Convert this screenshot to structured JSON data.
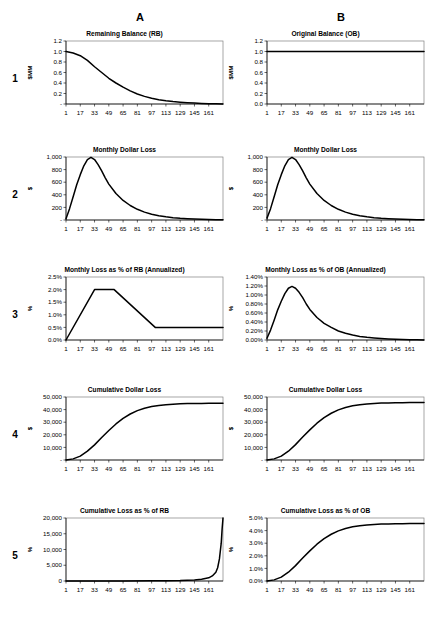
{
  "figure": {
    "column_headers": [
      {
        "label": "A",
        "x": 140
      },
      {
        "label": "B",
        "x": 341
      }
    ],
    "row_numbers": [
      "1",
      "2",
      "3",
      "4",
      "5"
    ],
    "x_tick_labels": [
      "1",
      "17",
      "33",
      "49",
      "65",
      "81",
      "97",
      "113",
      "129",
      "145",
      "161"
    ],
    "x_domain": [
      1,
      177
    ],
    "line_color": "#000000",
    "frame_color": "#808080"
  },
  "chart_data": [
    {
      "id": "r1a",
      "type": "line",
      "title": "Remaining Balance (RB)",
      "row": "1",
      "column": "A",
      "xlabel": "",
      "ylabel": "$MM",
      "ylim": [
        0,
        1.2
      ],
      "ytick_labels": [
        "-",
        "0.2",
        "0.4",
        "0.6",
        "0.8",
        "1.0",
        "1.2"
      ],
      "ytick_values": [
        0,
        0.2,
        0.4,
        0.6,
        0.8,
        1.0,
        1.2
      ],
      "xtick_values": [
        1,
        17,
        33,
        49,
        65,
        81,
        97,
        113,
        129,
        145,
        161
      ],
      "x": [
        1,
        9,
        17,
        25,
        33,
        41,
        49,
        57,
        65,
        73,
        81,
        89,
        97,
        105,
        113,
        121,
        129,
        137,
        145,
        153,
        161,
        169,
        177
      ],
      "y": [
        1.0,
        0.97,
        0.92,
        0.83,
        0.71,
        0.6,
        0.49,
        0.4,
        0.32,
        0.25,
        0.19,
        0.145,
        0.11,
        0.083,
        0.062,
        0.046,
        0.034,
        0.024,
        0.017,
        0.011,
        0.007,
        0.003,
        0.0
      ]
    },
    {
      "id": "r1b",
      "type": "line",
      "title": "Original Balance (OB)",
      "row": "1",
      "column": "B",
      "xlabel": "",
      "ylabel": "$MM",
      "ylim": [
        0,
        1.2
      ],
      "ytick_labels": [
        "0.0",
        "0.2",
        "0.4",
        "0.6",
        "0.8",
        "1.0",
        "1.2"
      ],
      "ytick_values": [
        0,
        0.2,
        0.4,
        0.6,
        0.8,
        1.0,
        1.2
      ],
      "xtick_values": [
        1,
        17,
        33,
        49,
        65,
        81,
        97,
        113,
        129,
        145,
        161
      ],
      "x": [
        1,
        177
      ],
      "y": [
        1.0,
        1.0
      ]
    },
    {
      "id": "r2a",
      "type": "line",
      "title": "Monthly Dollar Loss",
      "row": "2",
      "column": "A",
      "xlabel": "",
      "ylabel": "$",
      "ylim": [
        0,
        1000
      ],
      "ytick_labels": [
        "-",
        "200",
        "400",
        "600",
        "800",
        "1,000"
      ],
      "ytick_values": [
        0,
        200,
        400,
        600,
        800,
        1000
      ],
      "xtick_values": [
        1,
        17,
        33,
        49,
        65,
        81,
        97,
        113,
        129,
        145,
        161
      ],
      "x": [
        1,
        5,
        9,
        13,
        17,
        21,
        25,
        29,
        33,
        37,
        41,
        45,
        49,
        57,
        65,
        73,
        81,
        89,
        97,
        105,
        113,
        121,
        129,
        137,
        145,
        153,
        161,
        169,
        177
      ],
      "y": [
        20,
        180,
        370,
        560,
        720,
        860,
        960,
        995,
        960,
        880,
        780,
        670,
        570,
        420,
        310,
        230,
        170,
        125,
        92,
        68,
        50,
        37,
        27,
        20,
        14,
        10,
        7,
        4,
        2
      ]
    },
    {
      "id": "r2b",
      "type": "line",
      "title": "Monthly Dollar Loss",
      "row": "2",
      "column": "B",
      "xlabel": "",
      "ylabel": "$",
      "ylim": [
        0,
        1000
      ],
      "ytick_labels": [
        "-",
        "200",
        "400",
        "600",
        "800",
        "1,000"
      ],
      "ytick_values": [
        0,
        200,
        400,
        600,
        800,
        1000
      ],
      "xtick_values": [
        1,
        17,
        33,
        49,
        65,
        81,
        97,
        113,
        129,
        145,
        161
      ],
      "x": [
        1,
        5,
        9,
        13,
        17,
        21,
        25,
        29,
        33,
        37,
        41,
        45,
        49,
        57,
        65,
        73,
        81,
        89,
        97,
        105,
        113,
        121,
        129,
        137,
        145,
        153,
        161,
        169,
        177
      ],
      "y": [
        30,
        180,
        370,
        560,
        720,
        860,
        960,
        995,
        960,
        880,
        780,
        670,
        570,
        420,
        310,
        230,
        170,
        125,
        92,
        68,
        50,
        37,
        27,
        20,
        14,
        10,
        7,
        4,
        2
      ]
    },
    {
      "id": "r3a",
      "type": "line",
      "title": "Monthly Loss as % of RB (Annualized)",
      "row": "3",
      "column": "A",
      "xlabel": "",
      "ylabel": "%",
      "ylim": [
        0,
        2.5
      ],
      "ytick_labels": [
        "0.0%",
        "0.5%",
        "1.0%",
        "1.5%",
        "2.0%",
        "2.5%"
      ],
      "ytick_values": [
        0,
        0.5,
        1.0,
        1.5,
        2.0,
        2.5
      ],
      "xtick_values": [
        1,
        17,
        33,
        49,
        65,
        81,
        97,
        113,
        129,
        145,
        161
      ],
      "x": [
        1,
        33,
        55,
        101,
        177
      ],
      "y": [
        0.0,
        2.0,
        2.0,
        0.5,
        0.5
      ]
    },
    {
      "id": "r3b",
      "type": "line",
      "title": "Monthly Loss as % of OB (Annualized)",
      "row": "3",
      "column": "B",
      "xlabel": "",
      "ylabel": "%",
      "ylim": [
        0,
        1.4
      ],
      "ytick_labels": [
        "0.00%",
        "0.20%",
        "0.40%",
        "0.60%",
        "0.80%",
        "1.00%",
        "1.20%",
        "1.40%"
      ],
      "ytick_values": [
        0,
        0.2,
        0.4,
        0.6,
        0.8,
        1.0,
        1.2,
        1.4
      ],
      "xtick_values": [
        1,
        17,
        33,
        49,
        65,
        81,
        97,
        113,
        129,
        145,
        161
      ],
      "x": [
        1,
        5,
        9,
        13,
        17,
        21,
        25,
        29,
        33,
        37,
        41,
        45,
        49,
        57,
        65,
        73,
        81,
        89,
        97,
        105,
        113,
        121,
        129,
        137,
        145,
        153,
        161,
        169,
        177
      ],
      "y": [
        0.04,
        0.22,
        0.44,
        0.67,
        0.86,
        1.03,
        1.15,
        1.19,
        1.15,
        1.06,
        0.94,
        0.8,
        0.68,
        0.5,
        0.37,
        0.28,
        0.2,
        0.15,
        0.11,
        0.08,
        0.06,
        0.045,
        0.033,
        0.024,
        0.017,
        0.012,
        0.008,
        0.005,
        0.002
      ]
    },
    {
      "id": "r4a",
      "type": "line",
      "title": "Cumulative Dollar Loss",
      "row": "4",
      "column": "A",
      "xlabel": "",
      "ylabel": "$",
      "ylim": [
        0,
        50000
      ],
      "ytick_labels": [
        "-",
        "10,000",
        "20,000",
        "30,000",
        "40,000",
        "50,000"
      ],
      "ytick_values": [
        0,
        10000,
        20000,
        30000,
        40000,
        50000
      ],
      "xtick_values": [
        1,
        17,
        33,
        49,
        65,
        81,
        97,
        113,
        129,
        145,
        161
      ],
      "x": [
        1,
        9,
        17,
        25,
        33,
        41,
        49,
        57,
        65,
        73,
        81,
        89,
        97,
        105,
        113,
        121,
        129,
        137,
        145,
        153,
        161,
        169,
        177
      ],
      "y": [
        0,
        900,
        3100,
        7000,
        12000,
        17800,
        23400,
        28600,
        33000,
        36500,
        39200,
        41100,
        42400,
        43300,
        43900,
        44300,
        44600,
        44750,
        44850,
        44920,
        44960,
        44985,
        45000
      ]
    },
    {
      "id": "r4b",
      "type": "line",
      "title": "Cumulative Dollar Loss",
      "row": "4",
      "column": "B",
      "xlabel": "",
      "ylabel": "$",
      "ylim": [
        0,
        50000
      ],
      "ytick_labels": [
        "-",
        "10,000",
        "20,000",
        "30,000",
        "40,000",
        "50,000"
      ],
      "ytick_values": [
        0,
        10000,
        20000,
        30000,
        40000,
        50000
      ],
      "xtick_values": [
        1,
        17,
        33,
        49,
        65,
        81,
        97,
        113,
        129,
        145,
        161
      ],
      "x": [
        1,
        9,
        17,
        25,
        33,
        41,
        49,
        57,
        65,
        73,
        81,
        89,
        97,
        105,
        113,
        121,
        129,
        137,
        145,
        153,
        161,
        169,
        177
      ],
      "y": [
        0,
        900,
        3100,
        7000,
        12200,
        18200,
        23900,
        29200,
        33600,
        37100,
        39800,
        41700,
        43000,
        43900,
        44500,
        44900,
        45150,
        45320,
        45420,
        45490,
        45540,
        45570,
        45600
      ]
    },
    {
      "id": "r5a",
      "type": "line",
      "title": "Cumulative Loss as % of RB",
      "row": "5",
      "column": "A",
      "xlabel": "",
      "ylabel": "%",
      "ylim": [
        0,
        20000
      ],
      "ytick_labels": [
        "0",
        "5,000",
        "10,000",
        "15,000",
        "20,000"
      ],
      "ytick_values": [
        0,
        5000,
        10000,
        15000,
        20000
      ],
      "xtick_values": [
        1,
        17,
        33,
        49,
        65,
        81,
        97,
        113,
        129,
        145,
        161
      ],
      "x": [
        1,
        33,
        65,
        97,
        113,
        129,
        145,
        153,
        161,
        165,
        169,
        171,
        173,
        175,
        176,
        177
      ],
      "y": [
        0,
        5,
        15,
        40,
        80,
        150,
        330,
        560,
        1000,
        1600,
        2800,
        4200,
        7000,
        12000,
        16500,
        20000
      ]
    },
    {
      "id": "r5b",
      "type": "line",
      "title": "Cumulative Loss as % of OB",
      "row": "5",
      "column": "B",
      "xlabel": "",
      "ylabel": "%",
      "ylim": [
        0,
        5.0
      ],
      "ytick_labels": [
        "0.0%",
        "1.0%",
        "2.0%",
        "3.0%",
        "4.0%",
        "5.0%"
      ],
      "ytick_values": [
        0,
        1,
        2,
        3,
        4,
        5
      ],
      "xtick_values": [
        1,
        17,
        33,
        49,
        65,
        81,
        97,
        113,
        129,
        145,
        161
      ],
      "x": [
        1,
        9,
        17,
        25,
        33,
        41,
        49,
        57,
        65,
        73,
        81,
        89,
        97,
        105,
        113,
        121,
        129,
        137,
        145,
        153,
        161,
        169,
        177
      ],
      "y": [
        0.0,
        0.09,
        0.31,
        0.7,
        1.22,
        1.82,
        2.39,
        2.92,
        3.36,
        3.71,
        3.98,
        4.17,
        4.3,
        4.39,
        4.45,
        4.49,
        4.515,
        4.532,
        4.542,
        4.549,
        4.554,
        4.557,
        4.56
      ]
    }
  ]
}
